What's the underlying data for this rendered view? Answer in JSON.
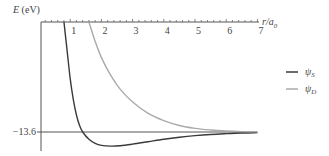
{
  "chart_data": {
    "type": "line",
    "title": "",
    "ylabel": "E (eV)",
    "xlabel": "r/a0",
    "xlim": [
      0,
      7
    ],
    "ylim": [
      -15.5,
      0
    ],
    "x_ticks": [
      1,
      2,
      3,
      4,
      5,
      6,
      7
    ],
    "x_tick_labels": [
      "1",
      "2",
      "3",
      "4",
      "5",
      "6",
      "7"
    ],
    "minor_ticks_per_unit": 5,
    "reference_line": {
      "y": -13.6,
      "label": "−13.6"
    },
    "legend_position": "right",
    "series": [
      {
        "name": "ψS",
        "color": "#3a3a3a",
        "x": [
          0.8,
          0.9,
          1.0,
          1.1,
          1.2,
          1.3,
          1.4,
          1.6,
          1.8,
          2.0,
          2.3,
          2.6,
          3.0,
          3.5,
          4.0,
          4.5,
          5.0,
          5.5,
          6.0,
          6.5,
          7.0
        ],
        "y": [
          0,
          -3.5,
          -7.0,
          -9.6,
          -11.5,
          -12.8,
          -13.6,
          -14.5,
          -15.0,
          -15.25,
          -15.35,
          -15.3,
          -15.1,
          -14.8,
          -14.5,
          -14.25,
          -14.05,
          -13.9,
          -13.8,
          -13.72,
          -13.68
        ]
      },
      {
        "name": "ψD",
        "color": "#aaaaaa",
        "x": [
          1.6,
          1.8,
          2.0,
          2.3,
          2.6,
          3.0,
          3.5,
          4.0,
          4.5,
          5.0,
          5.5,
          6.0,
          6.5,
          7.0
        ],
        "y": [
          0,
          -2.4,
          -4.4,
          -6.6,
          -8.3,
          -9.9,
          -11.3,
          -12.2,
          -12.8,
          -13.15,
          -13.35,
          -13.48,
          -13.55,
          -13.58
        ]
      }
    ]
  },
  "legend": {
    "items": [
      {
        "symbol": "ψ",
        "sub": "S"
      },
      {
        "symbol": "ψ",
        "sub": "D"
      }
    ]
  },
  "axis": {
    "y_title_main": "E",
    "y_title_unit": " (eV)",
    "x_title_main": "r/a",
    "x_title_sub": "0",
    "ref_label": "−13.6"
  }
}
